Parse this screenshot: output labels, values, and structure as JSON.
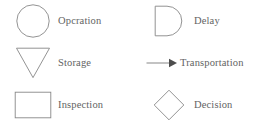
{
  "legend": {
    "title": "Flowchart symbol legend",
    "rows": [
      {
        "cells": [
          {
            "icon": "circle-icon",
            "shape": "circle",
            "label": "Opcration"
          },
          {
            "icon": "d-shape-icon",
            "shape": "d-shape",
            "label": "Delay"
          }
        ]
      },
      {
        "cells": [
          {
            "icon": "inverted-triangle-icon",
            "shape": "inverted-triangle",
            "label": "Storage"
          },
          {
            "icon": "arrow-right-icon",
            "shape": "arrow",
            "label": "Transportation"
          }
        ]
      },
      {
        "cells": [
          {
            "icon": "rectangle-icon",
            "shape": "rectangle",
            "label": "Inspection"
          },
          {
            "icon": "diamond-icon",
            "shape": "diamond",
            "label": "Decision"
          }
        ]
      }
    ]
  },
  "colors": {
    "background": "#ffffff",
    "shape_stroke": "#878787",
    "label_text": "#636363",
    "arrow_head_fill": "#4d4d4d"
  }
}
